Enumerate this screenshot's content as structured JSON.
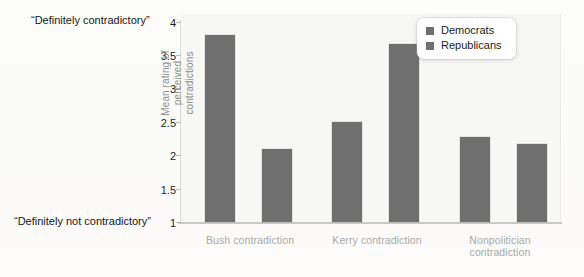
{
  "chart_data": {
    "type": "bar",
    "title": "",
    "subtitle": "",
    "xlabel": "",
    "ylabel": "Mean rating of perceived contradictions",
    "ylabel_line1": "Mean rating of perceived",
    "ylabel_line2": "contradictions",
    "ylim": [
      1,
      4
    ],
    "ytick_labels": [
      "4",
      "3.5",
      "3",
      "2.5",
      "2",
      "1.5",
      "1"
    ],
    "ytick_values": [
      4,
      3.5,
      3,
      2.5,
      2,
      1.5,
      1
    ],
    "grid": false,
    "legend_position": "top-right",
    "categories": [
      "Bush contradiction",
      "Kerry contradiction",
      "Nonpolitician contradiction"
    ],
    "category_lines": [
      [
        "Bush contradiction"
      ],
      [
        "Kerry contradiction"
      ],
      [
        "Nonpolitician",
        "contradiction"
      ]
    ],
    "series": [
      {
        "name": "Democrats",
        "values": [
          3.8,
          2.5,
          2.27
        ],
        "color": "#6f6f6f"
      },
      {
        "name": "Republicans",
        "values": [
          2.1,
          3.67,
          2.17
        ],
        "color": "#6f6f6f"
      }
    ],
    "annotations": [
      {
        "id": "anchor-high",
        "text": "“Definitely contradictory”",
        "at_value": 4
      },
      {
        "id": "anchor-low",
        "text": "“Definitely not contradictory”",
        "at_value": 1
      }
    ]
  },
  "legend": {
    "items": [
      {
        "label": "Democrats",
        "color": "#6f6f6f"
      },
      {
        "label": "Republicans",
        "color": "#6f6f6f"
      }
    ]
  },
  "colors": {
    "bar": "#6f6f6f",
    "plot_background": "#f7f7f5",
    "page_background": "#fefefe",
    "axis": "#c9c9c6",
    "tick_text": "#1d1d1d",
    "category_text": "#a8a8a6",
    "ylabel_text": "#8e8e8c"
  }
}
